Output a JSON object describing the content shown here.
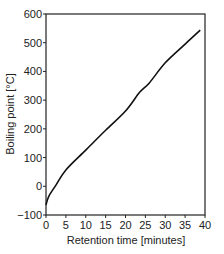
{
  "chart_data": {
    "type": "line",
    "title": "",
    "xlabel": "Retention time [minutes]",
    "ylabel": "Boiling point [°C]",
    "xlim": [
      0,
      40
    ],
    "ylim": [
      -100,
      600
    ],
    "xticks": [
      0,
      5,
      10,
      15,
      20,
      25,
      30,
      35,
      40
    ],
    "yticks": [
      -100,
      0,
      100,
      200,
      300,
      400,
      500,
      600
    ],
    "xtick_labels": [
      "0",
      "5",
      "10",
      "15",
      "20",
      "25",
      "30",
      "35",
      "40"
    ],
    "ytick_labels": [
      "−100",
      "0",
      "100",
      "200",
      "300",
      "400",
      "500",
      "600"
    ],
    "grid": false,
    "legend": null,
    "series": [
      {
        "name": "Boiling point vs retention time",
        "color": "#111111",
        "x": [
          0,
          0.7,
          2.5,
          5,
          10,
          15,
          20,
          23.6,
          26,
          30,
          35,
          38.8
        ],
        "y": [
          -65,
          -35,
          4,
          57,
          126,
          195,
          262,
          328,
          360,
          430,
          495,
          544
        ]
      }
    ]
  }
}
